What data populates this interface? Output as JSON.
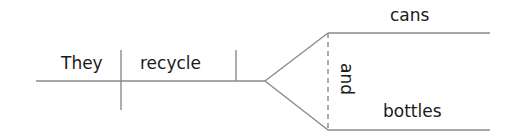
{
  "diagram": {
    "type": "sentence-diagram",
    "sentence": "They recycle cans and bottles",
    "subject": "They",
    "verb": "recycle",
    "compound_object": {
      "conjunction": "and",
      "items": [
        "cans",
        "bottles"
      ]
    },
    "colors": {
      "line": "#8a8a8a",
      "text": "#1a1a1a",
      "background": "#ffffff"
    }
  }
}
